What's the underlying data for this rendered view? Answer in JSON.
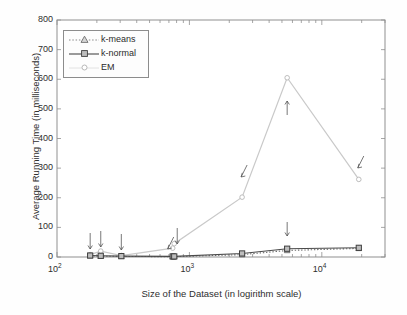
{
  "chart_data": {
    "type": "line",
    "title": "",
    "xlabel": "Size of the Dataset (in logirithm scale)",
    "ylabel": "Average Running Time (in milliseconds)",
    "xscale": "log",
    "xlim": [
      100,
      30000
    ],
    "ylim": [
      0,
      800
    ],
    "yticks": [
      "0",
      "100",
      "200",
      "300",
      "400",
      "500",
      "600",
      "700",
      "800"
    ],
    "xticks": [
      {
        "label": "10",
        "exp": "2",
        "value": 100
      },
      {
        "label": "10",
        "exp": "3",
        "value": 1000
      },
      {
        "label": "10",
        "exp": "4",
        "value": 10000
      }
    ],
    "grid": false,
    "legend_position": "upper left",
    "x": [
      178,
      214,
      306,
      748,
      768,
      2500,
      5473,
      19020
    ],
    "series": [
      {
        "name": "k-means",
        "marker": "triangle",
        "linestyle": "dotted",
        "color": "#6e6e6e",
        "values": [
          4,
          3,
          2,
          1,
          1,
          8,
          22,
          29
        ]
      },
      {
        "name": "k-normal",
        "marker": "square",
        "linestyle": "solid",
        "color": "#4a4a4a",
        "values": [
          5,
          4,
          3,
          2,
          2,
          12,
          28,
          31
        ]
      },
      {
        "name": "EM",
        "marker": "circle",
        "linestyle": "solid",
        "color": "#c9c9c9",
        "values": [
          8,
          20,
          5,
          30,
          45,
          202,
          605,
          262
        ]
      }
    ],
    "annotations": [
      {
        "text": "Wine",
        "x": 178,
        "arrow": "down",
        "label_bottom_y": 185
      },
      {
        "text": "Glass Identification",
        "x": 214,
        "arrow": "down",
        "label_bottom_y": 185
      },
      {
        "text": "Haberman's Survial",
        "x": 306,
        "arrow": "down",
        "label_bottom_y": 185
      },
      {
        "text": "Blood Transfusion Service Center",
        "x": 748,
        "arrow": "down-left",
        "label_bottom_y": 185
      },
      {
        "text": "Pima Indians Diabetes",
        "x": 768,
        "arrow": "down",
        "label_bottom_y": 185
      },
      {
        "text": "The Synthetic Dataset",
        "x": 2500,
        "arrow": "down-left",
        "label_bottom_y": 260
      },
      {
        "text": "Page Blocks Classification",
        "x": 5473,
        "arrow": "both",
        "label_bottom_y": 260
      },
      {
        "text": "MAGIC Gamma Telescope",
        "x": 19020,
        "arrow": "down-left",
        "label_bottom_y": 300
      }
    ]
  },
  "legend": {
    "entries": [
      {
        "label": "k-means"
      },
      {
        "label": "k-normal"
      },
      {
        "label": "EM"
      }
    ]
  }
}
